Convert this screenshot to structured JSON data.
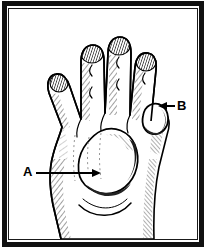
{
  "figure": {
    "background_color": "#ffffff",
    "ink_color": "#000000",
    "frame": {
      "style": "thick black rectangular border with thin inner rule",
      "outer_color": "#111111",
      "inner_color": "#1a1a1a"
    },
    "subject": {
      "name": "hand-dorsal-view",
      "description": "Pen-and-ink crosshatched line drawing of a right hand seen from the back, fingers extended upward, thumb to the left, wrist at bottom",
      "shading": "cross-hatch and stipple line shading"
    }
  },
  "annotations": [
    {
      "id": "a",
      "label": "A",
      "arrow_direction": "right",
      "target": "swelling on dorsum of hand",
      "label_position": {
        "x": 23,
        "y": 165
      },
      "arrow_start": {
        "x": 36,
        "y": 173
      },
      "arrow_end": {
        "x": 101,
        "y": 173
      }
    },
    {
      "id": "b",
      "label": "B",
      "arrow_direction": "left",
      "target": "nodule near little finger knuckle",
      "label_position": {
        "x": 177,
        "y": 99
      },
      "arrow_start": {
        "x": 175,
        "y": 106
      },
      "arrow_end": {
        "x": 158,
        "y": 106
      }
    }
  ]
}
